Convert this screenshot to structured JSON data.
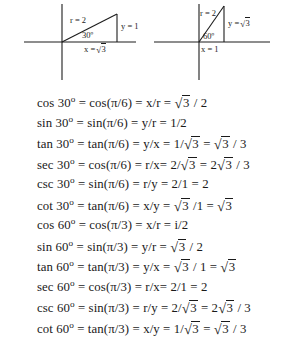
{
  "figure": {
    "type": "trig-reference-figure",
    "diagrams": [
      {
        "name": "30-degree-right-triangle",
        "angle_label": "30º",
        "hypotenuse_label": "r = 2",
        "vertical_leg_label": "y = 1",
        "horizontal_leg_label_prefix": "x =",
        "horizontal_leg_label_radicand": "3",
        "horizontal_leg_label": "x = √3"
      },
      {
        "name": "60-degree-right-triangle",
        "angle_label": "60º",
        "hypotenuse_label": "r = 2",
        "vertical_leg_label_prefix": "y =",
        "vertical_leg_label_radicand": "3",
        "vertical_leg_label": "y = √3",
        "horizontal_leg_label": "x = 1"
      }
    ],
    "equations": [
      {
        "id": "cos-30",
        "func": "cos",
        "angle": "30",
        "parts": [
          {
            "t": "text",
            "v": "cos 30"
          },
          {
            "t": "deg"
          },
          {
            "t": "text",
            "v": " = cos(π/6) = x/r = "
          },
          {
            "t": "sqrt",
            "v": "3"
          },
          {
            "t": "text",
            "v": " / 2"
          }
        ]
      },
      {
        "id": "sin-30",
        "func": "sin",
        "angle": "30",
        "parts": [
          {
            "t": "text",
            "v": "sin 30"
          },
          {
            "t": "deg"
          },
          {
            "t": "text",
            "v": " = sin(π/6) = y/r = 1/2"
          }
        ]
      },
      {
        "id": "tan-30",
        "func": "tan",
        "angle": "30",
        "parts": [
          {
            "t": "text",
            "v": "tan 30"
          },
          {
            "t": "deg"
          },
          {
            "t": "text",
            "v": " = tan(π/6) = y/x = 1/"
          },
          {
            "t": "sqrt",
            "v": "3"
          },
          {
            "t": "text",
            "v": "  = "
          },
          {
            "t": "sqrt",
            "v": "3"
          },
          {
            "t": "text",
            "v": " / 3"
          }
        ]
      },
      {
        "id": "sec-30",
        "func": "sec",
        "angle": "30",
        "parts": [
          {
            "t": "text",
            "v": "sec 30"
          },
          {
            "t": "deg"
          },
          {
            "t": "text",
            "v": " = cos(π/6) = r/x= 2/"
          },
          {
            "t": "sqrt",
            "v": "3"
          },
          {
            "t": "text",
            "v": "  = 2"
          },
          {
            "t": "sqrt",
            "v": "3"
          },
          {
            "t": "text",
            "v": " / 3"
          }
        ]
      },
      {
        "id": "csc-30",
        "func": "csc",
        "angle": "30",
        "parts": [
          {
            "t": "text",
            "v": "csc 30"
          },
          {
            "t": "deg"
          },
          {
            "t": "text",
            "v": " = sin(π/6) = r/y = 2/1 = 2"
          }
        ]
      },
      {
        "id": "cot-30",
        "func": "cot",
        "angle": "30",
        "parts": [
          {
            "t": "text",
            "v": "cot 30"
          },
          {
            "t": "deg"
          },
          {
            "t": "text",
            "v": " = tan(π/6) = x/y = "
          },
          {
            "t": "sqrt",
            "v": "3"
          },
          {
            "t": "text",
            "v": " /1 = "
          },
          {
            "t": "sqrt",
            "v": "3"
          }
        ]
      },
      {
        "id": "cos-60",
        "func": "cos",
        "angle": "60",
        "parts": [
          {
            "t": "text",
            "v": "cos 60"
          },
          {
            "t": "deg"
          },
          {
            "t": "text",
            "v": " = cos(π/3) = x/r = i/2"
          }
        ]
      },
      {
        "id": "sin-60",
        "func": "sin",
        "angle": "60",
        "parts": [
          {
            "t": "text",
            "v": "sin 60"
          },
          {
            "t": "deg"
          },
          {
            "t": "text",
            "v": " = sin(π/3) = y/r = "
          },
          {
            "t": "sqrt",
            "v": "3"
          },
          {
            "t": "text",
            "v": " / 2"
          }
        ]
      },
      {
        "id": "tan-60",
        "func": "tan",
        "angle": "60",
        "parts": [
          {
            "t": "text",
            "v": "tan 60"
          },
          {
            "t": "deg"
          },
          {
            "t": "text",
            "v": " = tan(π/3) = y/x = "
          },
          {
            "t": "sqrt",
            "v": "3"
          },
          {
            "t": "text",
            "v": " / 1 = "
          },
          {
            "t": "sqrt",
            "v": "3"
          }
        ]
      },
      {
        "id": "sec-60",
        "func": "sec",
        "angle": "60",
        "parts": [
          {
            "t": "text",
            "v": "sec 60"
          },
          {
            "t": "deg"
          },
          {
            "t": "text",
            "v": " = cos(π/3) = r/x= 2/1 = 2"
          }
        ]
      },
      {
        "id": "csc-60",
        "func": "csc",
        "angle": "60",
        "parts": [
          {
            "t": "text",
            "v": "csc 60"
          },
          {
            "t": "deg"
          },
          {
            "t": "text",
            "v": " = sin(π/3) = r/y = 2/"
          },
          {
            "t": "sqrt",
            "v": "3"
          },
          {
            "t": "text",
            "v": "  = 2"
          },
          {
            "t": "sqrt",
            "v": "3"
          },
          {
            "t": "text",
            "v": " / 3"
          }
        ]
      },
      {
        "id": "cot-60",
        "func": "cot",
        "angle": "60",
        "parts": [
          {
            "t": "text",
            "v": "cot 60"
          },
          {
            "t": "deg"
          },
          {
            "t": "text",
            "v": " = tan(π/3) = x/y = 1/"
          },
          {
            "t": "sqrt",
            "v": "3"
          },
          {
            "t": "text",
            "v": "  = "
          },
          {
            "t": "sqrt",
            "v": "3"
          },
          {
            "t": "text",
            "v": " / 3"
          }
        ]
      }
    ]
  },
  "colors": {
    "ink": "#1a1a1a",
    "line": "#1c1c1c",
    "background": "#ffffff"
  }
}
